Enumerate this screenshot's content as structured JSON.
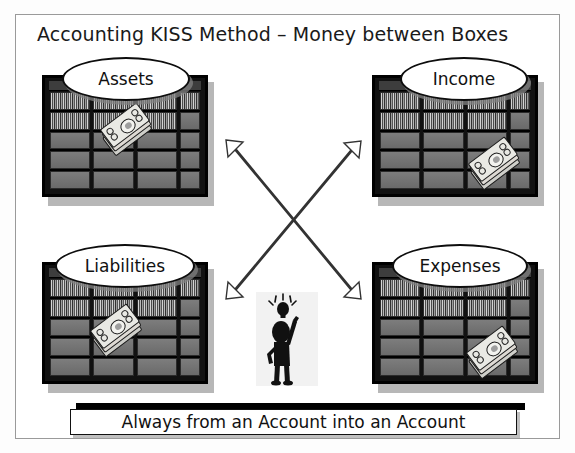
{
  "diagram": {
    "title": "Accounting KISS Method – Money between Boxes",
    "footer_banner": "Always from an Account into an Account",
    "boxes": [
      {
        "label": "Assets",
        "position": "top-left",
        "icon": "money-stack-icon",
        "money_placement": "upper-middle"
      },
      {
        "label": "Income",
        "position": "top-right",
        "icon": "money-stack-icon",
        "money_placement": "lower-right"
      },
      {
        "label": "Liabilities",
        "position": "bottom-left",
        "icon": "money-stack-icon",
        "money_placement": "middle-left"
      },
      {
        "label": "Expenses",
        "position": "bottom-right",
        "icon": "money-stack-icon",
        "money_placement": "lower-right"
      }
    ],
    "arrows": [
      {
        "name": "assets-to-expenses",
        "style": "double-headed",
        "from": "Assets",
        "to": "Expenses"
      },
      {
        "name": "liabilities-to-income",
        "style": "double-headed",
        "from": "Liabilities",
        "to": "Income"
      }
    ],
    "figure": {
      "name": "stick-figure-with-idea",
      "icon": "lightbulb-icon"
    },
    "colors": {
      "frame_border": "#9a9a9a",
      "cabinet": "#000000",
      "shelf": "#7a7a7a",
      "text": "#111111",
      "background": "#ffffff"
    }
  }
}
